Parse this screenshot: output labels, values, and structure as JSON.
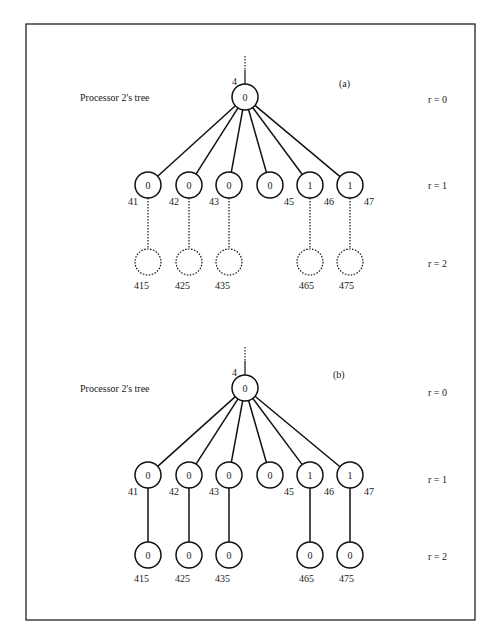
{
  "frame": {
    "x": 26,
    "y": 24,
    "w": 449,
    "h": 596
  },
  "trees": [
    {
      "id": "a",
      "panel_label": "(a)",
      "title": "Processor 2's tree",
      "root": {
        "id": "4",
        "value": "0",
        "x": 245,
        "y": 97
      },
      "level_labels": [
        "r = 0",
        "r = 1",
        "r = 2"
      ],
      "level_y": [
        97,
        185,
        262
      ],
      "level_label_y": [
        100,
        186,
        264
      ],
      "r1": [
        {
          "id": "41",
          "value": "0",
          "x": 148
        },
        {
          "id": "42",
          "value": "0",
          "x": 189
        },
        {
          "id": "43",
          "value": "0",
          "x": 229
        },
        {
          "id": "45",
          "value": "0",
          "x": 270
        },
        {
          "id": "46",
          "value": "1",
          "x": 310
        },
        {
          "id": "47",
          "value": "1",
          "x": 350
        }
      ],
      "r2": [
        {
          "id": "415",
          "value": "",
          "x": 148
        },
        {
          "id": "425",
          "value": "",
          "x": 189
        },
        {
          "id": "435",
          "value": "",
          "x": 229
        },
        {
          "id": "465",
          "value": "",
          "x": 310
        },
        {
          "id": "475",
          "value": "",
          "x": 350
        }
      ],
      "r2_style": "dashed"
    },
    {
      "id": "b",
      "panel_label": "(b)",
      "title": "Processor 2's tree",
      "root": {
        "id": "4",
        "value": "0",
        "x": 245,
        "y": 388
      },
      "level_labels": [
        "r = 0",
        "r = 1",
        "r = 2"
      ],
      "level_y": [
        388,
        475,
        555
      ],
      "level_label_y": [
        393,
        480,
        557
      ],
      "r1": [
        {
          "id": "41",
          "value": "0",
          "x": 148
        },
        {
          "id": "42",
          "value": "0",
          "x": 189
        },
        {
          "id": "43",
          "value": "0",
          "x": 229
        },
        {
          "id": "45",
          "value": "0",
          "x": 270
        },
        {
          "id": "46",
          "value": "1",
          "x": 310
        },
        {
          "id": "47",
          "value": "1",
          "x": 350
        }
      ],
      "r2": [
        {
          "id": "415",
          "value": "0",
          "x": 148
        },
        {
          "id": "425",
          "value": "0",
          "x": 189
        },
        {
          "id": "435",
          "value": "0",
          "x": 229
        },
        {
          "id": "465",
          "value": "0",
          "x": 310
        },
        {
          "id": "475",
          "value": "0",
          "x": 350
        }
      ],
      "r2_style": "solid"
    }
  ]
}
